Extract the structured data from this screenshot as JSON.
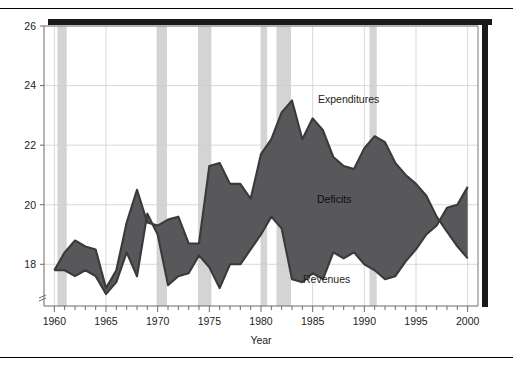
{
  "chart_data": {
    "type": "area",
    "title": "",
    "subtitle": "",
    "xlabel": "Year",
    "ylabel": "",
    "xlim": [
      1959,
      2001
    ],
    "ylim": [
      16.6,
      26
    ],
    "grid": true,
    "legend_position": "inline-annotations",
    "x_ticks_major": [
      1960,
      1965,
      1970,
      1975,
      1980,
      1985,
      1990,
      1995,
      2000
    ],
    "x_tick_labels": [
      "1960",
      "1965",
      "1970",
      "1975",
      "1980",
      "1985",
      "1990",
      "1995",
      "2000"
    ],
    "y_ticks": [
      18,
      20,
      22,
      24,
      26
    ],
    "y_tick_labels": [
      "18",
      "20",
      "22",
      "24",
      "26"
    ],
    "axis_break_marker": true,
    "fill_label": "Deficits",
    "colors": {
      "fill": "#58585a",
      "line": "#3a3a3c",
      "recession_band": "#d4d4d4",
      "grid": "#cfcfcf",
      "axis": "#6b6b6b",
      "frame_heavy": "#1a1a1a",
      "text": "#222222",
      "background": "#ffffff"
    },
    "x": [
      1960,
      1961,
      1962,
      1963,
      1964,
      1965,
      1966,
      1967,
      1968,
      1969,
      1970,
      1971,
      1972,
      1973,
      1974,
      1975,
      1976,
      1977,
      1978,
      1979,
      1980,
      1981,
      1982,
      1983,
      1984,
      1985,
      1986,
      1987,
      1988,
      1989,
      1990,
      1991,
      1992,
      1993,
      1994,
      1995,
      1996,
      1997,
      1998,
      1999,
      2000
    ],
    "series": [
      {
        "name": "Expenditures",
        "label": "Expenditures",
        "values": [
          17.8,
          18.4,
          18.8,
          18.6,
          18.5,
          17.2,
          17.8,
          19.4,
          20.5,
          19.4,
          19.3,
          19.5,
          19.6,
          18.7,
          18.7,
          21.3,
          21.4,
          20.7,
          20.7,
          20.2,
          21.7,
          22.2,
          23.1,
          23.5,
          22.2,
          22.9,
          22.5,
          21.6,
          21.3,
          21.2,
          21.9,
          22.3,
          22.1,
          21.4,
          21.0,
          20.7,
          20.3,
          19.6,
          19.1,
          18.6,
          18.2
        ],
        "ylim_note": "percent of GDP"
      },
      {
        "name": "Revenues",
        "label": "Revenues",
        "values": [
          17.8,
          17.8,
          17.6,
          17.8,
          17.6,
          17.0,
          17.4,
          18.4,
          17.6,
          19.7,
          19.0,
          17.3,
          17.6,
          17.7,
          18.3,
          17.9,
          17.2,
          18.0,
          18.0,
          18.5,
          19.0,
          19.6,
          19.2,
          17.5,
          17.4,
          17.7,
          17.5,
          18.4,
          18.2,
          18.4,
          18.0,
          17.8,
          17.5,
          17.6,
          18.1,
          18.5,
          19.0,
          19.3,
          19.9,
          20.0,
          20.6
        ]
      }
    ],
    "recession_bands": [
      {
        "start": 1960.3,
        "end": 1961.2
      },
      {
        "start": 1969.9,
        "end": 1970.9
      },
      {
        "start": 1973.9,
        "end": 1975.2
      },
      {
        "start": 1980.0,
        "end": 1980.6
      },
      {
        "start": 1981.5,
        "end": 1982.9
      },
      {
        "start": 1990.5,
        "end": 1991.2
      }
    ]
  },
  "annotations": {
    "expenditures": "Expenditures",
    "deficits": "Deficits",
    "revenues": "Revenues"
  },
  "axis": {
    "x_title": "Year"
  }
}
